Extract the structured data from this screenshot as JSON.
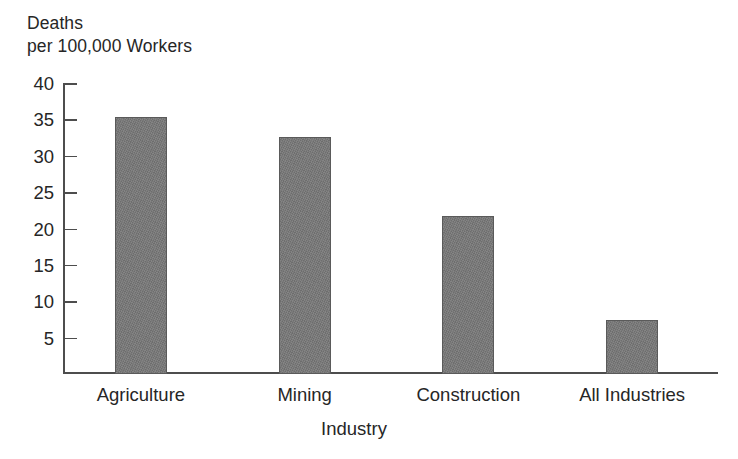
{
  "chart_data": {
    "type": "bar",
    "title": "",
    "subtitle": "",
    "xlabel": "Industry",
    "ylabel": "Deaths per 100,000 Workers",
    "ylabel_lines": [
      "Deaths",
      "per 100,000 Workers"
    ],
    "categories": [
      "Agriculture",
      "Mining",
      "Construction",
      "All Industries"
    ],
    "values": [
      35.3,
      32.6,
      21.7,
      7.4
    ],
    "ylim": [
      0,
      40
    ],
    "yticks": [
      5,
      10,
      15,
      20,
      25,
      30,
      35,
      40
    ],
    "ytick_labels": [
      "5",
      "10",
      "15",
      "20",
      "25",
      "30",
      "35",
      "40"
    ],
    "grid": false,
    "legend": false,
    "legend_position": "none",
    "bar_color": "#787878",
    "bar_edge_color": "#5a5a5a",
    "axis_color": "#4d4d4d",
    "text_color": "#262626",
    "background_color": "#ffffff"
  }
}
